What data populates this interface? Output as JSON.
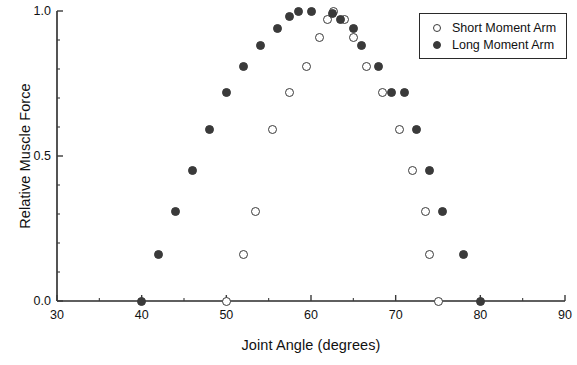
{
  "chart_data": {
    "type": "scatter",
    "title": "",
    "xlabel": "Joint Angle (degrees)",
    "ylabel": "Relative Muscle Force",
    "xlim": [
      30,
      90
    ],
    "ylim": [
      0.0,
      1.0
    ],
    "xticks": [
      30,
      40,
      50,
      60,
      70,
      80,
      90
    ],
    "xtick_labels": [
      "30",
      "40",
      "50",
      "60",
      "70",
      "80",
      "90"
    ],
    "x_minor_ticks": [
      35,
      45,
      55,
      65,
      75,
      85
    ],
    "yticks": [
      0.0,
      0.5,
      1.0
    ],
    "ytick_labels": [
      "0.0",
      "0.5",
      "1.0"
    ],
    "y_minor_ticks": [
      0.1,
      0.2,
      0.3,
      0.4,
      0.6,
      0.7,
      0.8,
      0.9
    ],
    "grid": false,
    "legend_position": "upper right",
    "marker_color": "#3a3a3a",
    "series": [
      {
        "name": "Short Moment Arm",
        "marker": "open-circle",
        "points": [
          [
            50.0,
            0.0
          ],
          [
            52.0,
            0.16
          ],
          [
            53.5,
            0.31
          ],
          [
            55.5,
            0.59
          ],
          [
            57.5,
            0.72
          ],
          [
            59.5,
            0.81
          ],
          [
            61.0,
            0.91
          ],
          [
            62.0,
            0.97
          ],
          [
            62.7,
            1.0
          ],
          [
            64.0,
            0.97
          ],
          [
            65.0,
            0.91
          ],
          [
            66.5,
            0.81
          ],
          [
            68.5,
            0.72
          ],
          [
            70.5,
            0.59
          ],
          [
            72.0,
            0.45
          ],
          [
            73.5,
            0.31
          ],
          [
            74.0,
            0.16
          ],
          [
            75.0,
            0.0
          ]
        ]
      },
      {
        "name": "Long Moment Arm",
        "marker": "filled-circle",
        "points": [
          [
            40.0,
            0.0
          ],
          [
            42.0,
            0.16
          ],
          [
            44.0,
            0.31
          ],
          [
            46.0,
            0.45
          ],
          [
            48.0,
            0.59
          ],
          [
            50.0,
            0.72
          ],
          [
            52.0,
            0.81
          ],
          [
            54.0,
            0.88
          ],
          [
            56.0,
            0.94
          ],
          [
            57.5,
            0.98
          ],
          [
            58.5,
            1.0
          ],
          [
            60.0,
            1.0
          ],
          [
            62.5,
            0.99
          ],
          [
            63.5,
            0.97
          ],
          [
            65.0,
            0.94
          ],
          [
            66.0,
            0.88
          ],
          [
            68.0,
            0.81
          ],
          [
            69.5,
            0.72
          ],
          [
            71.0,
            0.72
          ],
          [
            72.5,
            0.59
          ],
          [
            74.0,
            0.45
          ],
          [
            75.5,
            0.31
          ],
          [
            78.0,
            0.16
          ],
          [
            80.0,
            0.0
          ]
        ]
      }
    ]
  },
  "legend": {
    "entries": [
      {
        "label": "Short Moment Arm",
        "marker": "open-circle"
      },
      {
        "label": "Long Moment Arm",
        "marker": "filled-circle"
      }
    ]
  }
}
